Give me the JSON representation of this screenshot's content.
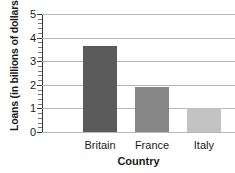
{
  "chart_data": {
    "type": "bar",
    "title": "",
    "subtitle": "",
    "xlabel": "Country",
    "ylabel": "Loans (in billions of dollars)",
    "categories": [
      "Britain",
      "France",
      "Italy"
    ],
    "values": [
      3.65,
      1.9,
      1.0
    ],
    "bar_colors": [
      "#5a5a5a",
      "#878787",
      "#c2c2c2"
    ],
    "ylim": [
      0,
      5
    ],
    "ytick_labels": [
      "0",
      "1",
      "2",
      "3",
      "4",
      "5"
    ],
    "ytick_values": [
      0,
      1,
      2,
      3,
      4,
      5
    ],
    "minor_tick_interval": 0.2,
    "grid": "horizontal",
    "legend": "none",
    "background_color": "#ffffff",
    "axis_color": "#3a3a3a",
    "gridline_color": "#b9b9b9"
  }
}
